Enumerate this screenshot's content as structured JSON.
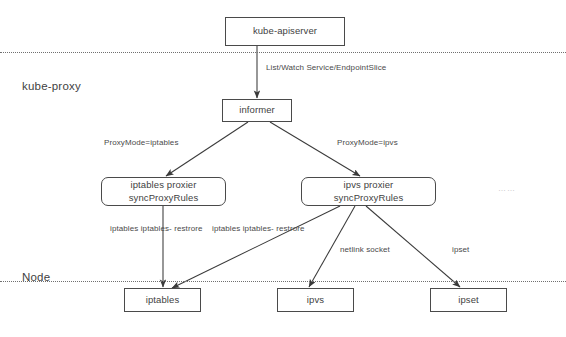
{
  "diagram": {
    "zones": [
      {
        "label": "kube-proxy"
      },
      {
        "label": "Node"
      }
    ],
    "nodes": [
      {
        "id": "kube-apiserver",
        "lines": [
          "kube-apiserver"
        ]
      },
      {
        "id": "informer",
        "lines": [
          "informer"
        ]
      },
      {
        "id": "iptables-proxier",
        "lines": [
          "iptables proxier",
          "syncProxyRules"
        ]
      },
      {
        "id": "ipvs-proxier",
        "lines": [
          "ipvs proxier",
          "syncProxyRules"
        ]
      },
      {
        "id": "iptables",
        "lines": [
          "iptables"
        ]
      },
      {
        "id": "ipvs",
        "lines": [
          "ipvs"
        ]
      },
      {
        "id": "ipset",
        "lines": [
          "ipset"
        ]
      }
    ],
    "edge_labels": [
      {
        "id": "list-watch",
        "lines": [
          "List/Watch",
          "Service/EndpointSlice"
        ]
      },
      {
        "id": "proxymode-iptables",
        "lines": [
          "ProxyMode=iptables"
        ]
      },
      {
        "id": "proxymode-ipvs",
        "lines": [
          "ProxyMode=ipvs"
        ]
      },
      {
        "id": "iptables-restore-1",
        "lines": [
          "iptables",
          "iptables-",
          "restrore"
        ]
      },
      {
        "id": "iptables-restore-2",
        "lines": [
          "iptables",
          "iptables-",
          "restrore"
        ]
      },
      {
        "id": "netlink-socket",
        "lines": [
          "netlink socket"
        ]
      },
      {
        "id": "ipset-edge",
        "lines": [
          "ipset"
        ]
      }
    ],
    "more_indicator": "……",
    "bottom_caption": "",
    "colors": {
      "stroke": "#4a4a4a",
      "text": "#3f3f3f",
      "separator": "#707070",
      "background": "#ffffff"
    }
  }
}
